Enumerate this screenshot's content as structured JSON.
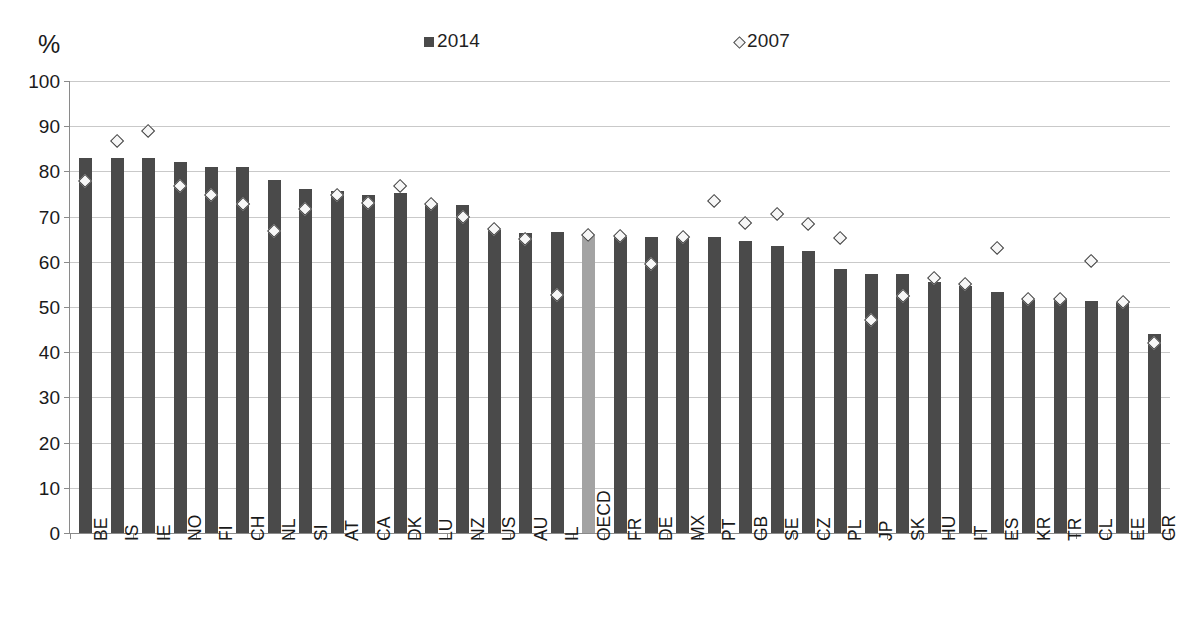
{
  "chart_data": {
    "type": "bar",
    "title": "",
    "xlabel": "",
    "ylabel": "%",
    "ylim": [
      0,
      100
    ],
    "ytick_step": 10,
    "yticks": [
      "100",
      "90",
      "80",
      "70",
      "60",
      "50",
      "40",
      "30",
      "20",
      "10",
      "0"
    ],
    "grid": true,
    "legend_position": "top-center",
    "legend": [
      {
        "label": "2014",
        "marker": "square",
        "color": "#4a4a4a"
      },
      {
        "label": "2007",
        "marker": "diamond",
        "color": "#4a4a4a"
      }
    ],
    "highlight_category": "OECD",
    "highlight_color": "#a3a3a3",
    "bar_color": "#4a4a4a",
    "categories": [
      "BE",
      "IS",
      "IE",
      "NO",
      "FI",
      "CH",
      "NL",
      "SI",
      "AT",
      "CA",
      "DK",
      "LU",
      "NZ",
      "US",
      "AU",
      "IL",
      "OECD",
      "FR",
      "DE",
      "MX",
      "PT",
      "GB",
      "SE",
      "CZ",
      "PL",
      "JP",
      "SK",
      "HU",
      "IT",
      "ES",
      "KR",
      "TR",
      "CL",
      "EE",
      "GR"
    ],
    "series": [
      {
        "name": "2014",
        "marker": "bar",
        "values": [
          83.0,
          83.0,
          83.0,
          82.0,
          81.0,
          81.0,
          78.0,
          76.0,
          75.6,
          74.8,
          75.2,
          73.0,
          72.6,
          67.0,
          66.3,
          66.5,
          65.8,
          65.6,
          65.5,
          65.6,
          65.6,
          64.6,
          63.4,
          62.5,
          58.3,
          57.4,
          57.4,
          55.5,
          54.6,
          53.3,
          51.6,
          51.7,
          51.3,
          51.0,
          44.0
        ]
      },
      {
        "name": "2007",
        "marker": "diamond",
        "values": [
          77.9,
          86.7,
          88.9,
          76.8,
          74.8,
          72.7,
          66.8,
          71.7,
          74.7,
          73.0,
          76.7,
          72.8,
          69.8,
          67.1,
          65.0,
          52.5,
          65.8,
          65.6,
          59.5,
          65.5,
          73.3,
          68.5,
          70.4,
          68.2,
          65.2,
          47.1,
          52.3,
          56.3,
          55.0,
          63.0,
          51.6,
          51.7,
          60.0,
          51.0,
          42.0
        ]
      }
    ]
  }
}
